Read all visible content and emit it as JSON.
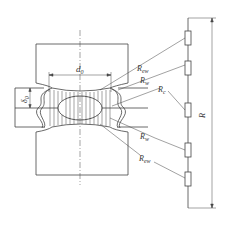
{
  "diagram": {
    "labels": {
      "d0": "d",
      "d0_sub": "0",
      "delta0": "δ",
      "delta0_sub": "0",
      "R": "R",
      "Rew_top": "R",
      "Rew_top_sub": "ew",
      "Rw_top": "R",
      "Rw_top_sub": "w",
      "Rc": "R",
      "Rc_sub": "c",
      "Rw_bottom": "R",
      "Rw_bottom_sub": "w",
      "Rew_bottom": "R",
      "Rew_bottom_sub": "ew"
    },
    "components": [
      "upper-electrode",
      "lower-electrode",
      "upper-sheet",
      "lower-sheet",
      "weld-nugget",
      "series-resistor-chain"
    ],
    "resistors": [
      "Rew",
      "Rw",
      "Rc",
      "Rw",
      "Rew"
    ],
    "colors": {
      "line": "#444444",
      "background": "#ffffff"
    }
  }
}
